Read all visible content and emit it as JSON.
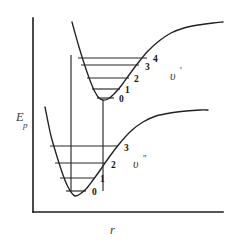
{
  "figure": {
    "background_color": "#ffffff",
    "curve_color": "#23211f",
    "axis_color": "#1c1c1c"
  },
  "axes": {
    "y_label_main": "E",
    "y_label_sub": "p",
    "x_label": "r",
    "x_origin": 33,
    "y_origin": 212,
    "y_top": 18,
    "x_right": 223
  },
  "chart_data": {
    "type": "line",
    "xlabel": "r",
    "ylabel": "E_p",
    "grid": false,
    "legend": "none",
    "annotations": [
      "v'",
      "v''"
    ],
    "series": [
      {
        "name": "upper-state-potential",
        "state_label": "v'",
        "description": "Excited electronic state Morse curve, minimum at upper right of lower well",
        "minimum": {
          "x": 103,
          "y": 100
        },
        "dissociation_asymptote_y": 23,
        "path_points": [
          [
            72,
            22
          ],
          [
            75,
            33
          ],
          [
            79,
            47
          ],
          [
            83,
            60
          ],
          [
            87,
            72
          ],
          [
            91,
            83
          ],
          [
            95,
            92
          ],
          [
            99,
            98
          ],
          [
            103,
            100
          ],
          [
            108,
            99
          ],
          [
            114,
            94
          ],
          [
            121,
            86
          ],
          [
            129,
            75
          ],
          [
            138,
            63
          ],
          [
            148,
            51
          ],
          [
            159,
            41
          ],
          [
            171,
            33
          ],
          [
            184,
            28
          ],
          [
            198,
            25
          ],
          [
            213,
            23
          ],
          [
            223,
            22
          ]
        ],
        "vibrational_levels": [
          {
            "v": 0,
            "label": "0",
            "y": 98,
            "x_left": 97,
            "x_right": 114,
            "label_x": 119,
            "label_y": 100
          },
          {
            "v": 1,
            "label": "1",
            "y": 89,
            "x_left": 92,
            "x_right": 120,
            "label_x": 125,
            "label_y": 91
          },
          {
            "v": 2,
            "label": "2",
            "y": 78,
            "x_left": 87,
            "x_right": 129,
            "label_x": 134,
            "label_y": 80
          },
          {
            "v": 3,
            "label": "3",
            "y": 65,
            "x_left": 81,
            "x_right": 139,
            "label_x": 145,
            "label_y": 68
          },
          {
            "v": 4,
            "label": "4",
            "y": 58,
            "x_left": 78,
            "x_right": 147,
            "label_x": 153,
            "label_y": 60
          }
        ]
      },
      {
        "name": "lower-state-potential",
        "state_label": "v''",
        "description": "Ground electronic state Morse curve",
        "minimum": {
          "x": 75,
          "y": 196
        },
        "dissociation_asymptote_y": 111,
        "path_points": [
          [
            45,
            107
          ],
          [
            48,
            122
          ],
          [
            51,
            136
          ],
          [
            55,
            150
          ],
          [
            59,
            163
          ],
          [
            63,
            175
          ],
          [
            67,
            185
          ],
          [
            71,
            192
          ],
          [
            75,
            196
          ],
          [
            80,
            194
          ],
          [
            86,
            189
          ],
          [
            93,
            180
          ],
          [
            101,
            169
          ],
          [
            110,
            156
          ],
          [
            120,
            143
          ],
          [
            131,
            131
          ],
          [
            143,
            122
          ],
          [
            156,
            116
          ],
          [
            170,
            113
          ],
          [
            186,
            111
          ],
          [
            200,
            110
          ],
          [
            208,
            110
          ]
        ],
        "vibrational_levels": [
          {
            "v": 0,
            "label": "0",
            "y": 191,
            "x_left": 66,
            "x_right": 86,
            "label_x": 92,
            "label_y": 193
          },
          {
            "v": 1,
            "label": "1",
            "y": 178,
            "x_left": 60,
            "x_right": 94,
            "label_x": 100,
            "label_y": 180
          },
          {
            "v": 2,
            "label": "2",
            "y": 163,
            "x_left": 55,
            "x_right": 105,
            "label_x": 111,
            "label_y": 166
          },
          {
            "v": 3,
            "label": "3",
            "y": 146,
            "x_left": 50,
            "x_right": 118,
            "label_x": 124,
            "label_y": 149
          }
        ]
      }
    ],
    "transitions": [
      {
        "name": "franck-condon-transition-left",
        "x": 71,
        "y_bottom": 191,
        "y_top": 55
      },
      {
        "name": "franck-condon-transition-right",
        "x": 103,
        "y_bottom": 191,
        "y_top": 100
      }
    ]
  },
  "labels": {
    "upper_state": {
      "symbol": "υ",
      "prime": "'"
    },
    "lower_state": {
      "symbol": "υ",
      "prime": "''"
    },
    "upper_state_pos": {
      "x": 170,
      "y": 77
    },
    "lower_state_pos": {
      "x": 133,
      "y": 165
    }
  }
}
